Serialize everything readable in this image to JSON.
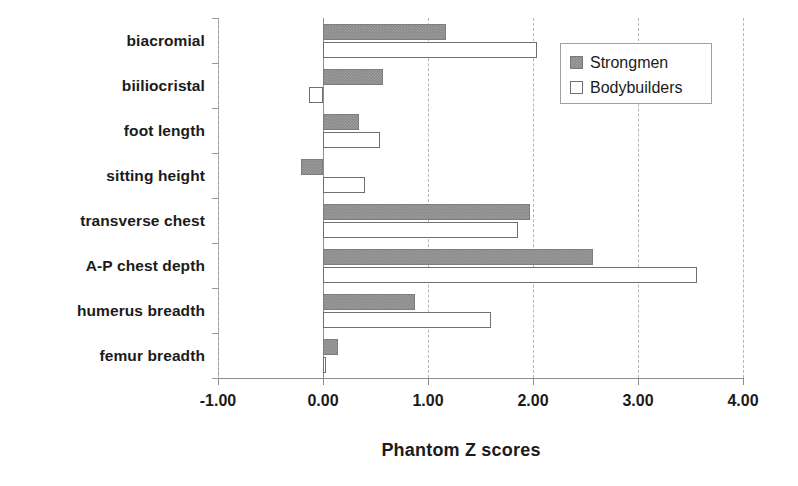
{
  "chart_data": {
    "type": "bar",
    "orientation": "horizontal",
    "title": "",
    "xlabel": "Phantom Z scores",
    "ylabel": "",
    "xlim": [
      -1.0,
      4.0
    ],
    "xticks": [
      "-1.00",
      "0.00",
      "1.00",
      "2.00",
      "3.00",
      "4.00"
    ],
    "xtick_values": [
      -1.0,
      0.0,
      1.0,
      2.0,
      3.0,
      4.0
    ],
    "grid": "vertical-dashed",
    "legend_position": "top-right",
    "categories": [
      "biacromial",
      "biiliocristal",
      "foot length",
      "sitting height",
      "transverse chest",
      "A-P chest depth",
      "humerus breadth",
      "femur breadth"
    ],
    "series": [
      {
        "name": "Strongmen",
        "color": "#8a8a8a",
        "fill": "solid-gray",
        "values": [
          1.17,
          0.57,
          0.34,
          -0.21,
          1.97,
          2.57,
          0.88,
          0.14
        ]
      },
      {
        "name": "Bodybuilders",
        "color": "#ffffff",
        "fill": "white-outline",
        "values": [
          2.04,
          -0.13,
          0.54,
          0.4,
          1.86,
          3.56,
          1.6,
          0.03
        ]
      }
    ]
  },
  "legend": {
    "items": [
      {
        "label": "Strongmen",
        "swatch": "filled-gray-square"
      },
      {
        "label": "Bodybuilders",
        "swatch": "white-outline-square"
      }
    ]
  },
  "axis": {
    "x_title": "Phantom Z scores"
  }
}
